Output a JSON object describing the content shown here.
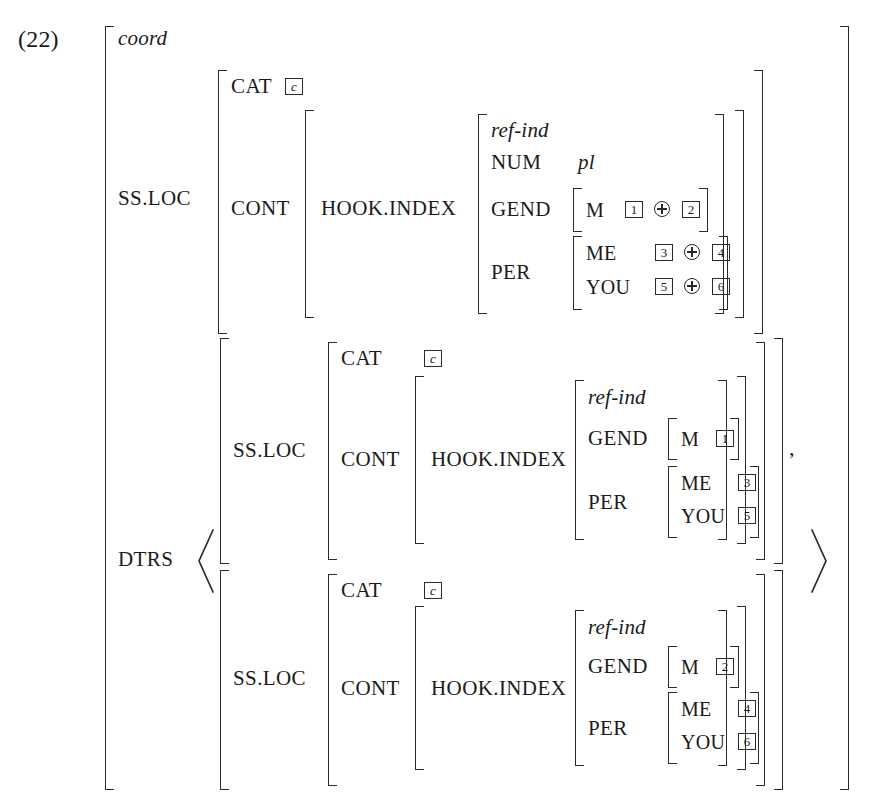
{
  "figure": {
    "example_number": "(22)",
    "root_type": "coord",
    "icons": {
      "oplus": "circled-plus-icon",
      "angle_open": "angle-bracket-open-icon",
      "angle_close": "angle-bracket-close-icon"
    }
  },
  "features": {
    "ss_loc": "SS.LOC",
    "cat": "CAT",
    "cont": "CONT",
    "hook_index": "HOOK.INDEX",
    "num": "NUM",
    "gend": "GEND",
    "per": "PER",
    "me": "ME",
    "you": "YOU",
    "dtrs": "DTRS",
    "m": "M"
  },
  "values": {
    "cat_tag": "c",
    "ref_ind": "ref-ind",
    "num_pl": "pl",
    "comma": ","
  },
  "mother": {
    "cat": "c",
    "index_type": "ref-ind",
    "num": "pl",
    "gend": {
      "m_left": "1",
      "op": "⊕",
      "m_right": "2"
    },
    "per": {
      "me": {
        "left": "3",
        "op": "⊕",
        "right": "4"
      },
      "you": {
        "left": "5",
        "op": "⊕",
        "right": "6"
      }
    }
  },
  "daughters": [
    {
      "cat": "c",
      "index_type": "ref-ind",
      "gend_m": "1",
      "per_me": "3",
      "per_you": "5",
      "separator": ","
    },
    {
      "cat": "c",
      "index_type": "ref-ind",
      "gend_m": "2",
      "per_me": "4",
      "per_you": "6",
      "separator": ""
    }
  ]
}
